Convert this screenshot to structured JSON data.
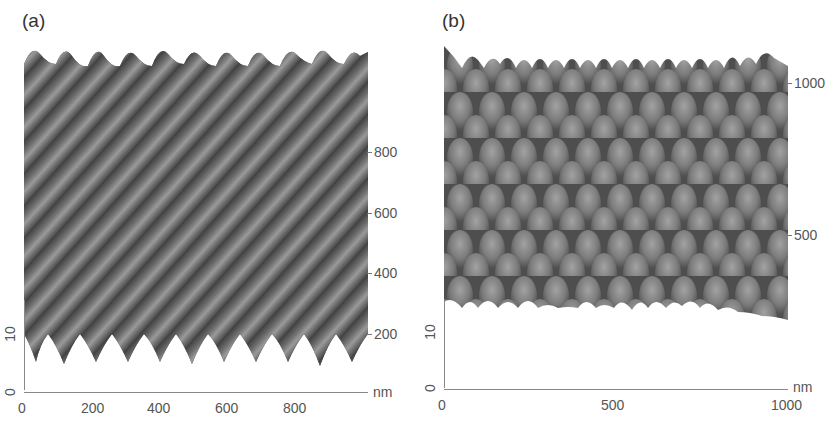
{
  "figure": {
    "type": "AFM 3D surface topography",
    "panels": [
      {
        "id": "a",
        "label": "(a)",
        "pattern": "diagonal line grating",
        "x_ticks": [
          "0",
          "200",
          "400",
          "600",
          "800"
        ],
        "y_ticks": [
          "200",
          "400",
          "600",
          "800"
        ],
        "z_ticks": [
          "0",
          "10"
        ],
        "unit": "nm"
      },
      {
        "id": "b",
        "label": "(b)",
        "pattern": "hexagonal dot array",
        "x_ticks": [
          "0",
          "500",
          "1000"
        ],
        "y_ticks": [
          "500",
          "1000"
        ],
        "z_ticks": [
          "0",
          "10"
        ],
        "unit": "nm"
      }
    ],
    "colors": {
      "surface_dark": "#4a4a4a",
      "surface_mid": "#7a7a7a",
      "surface_light": "#a8a8a8",
      "axis": "#888888",
      "text": "#555555"
    }
  }
}
